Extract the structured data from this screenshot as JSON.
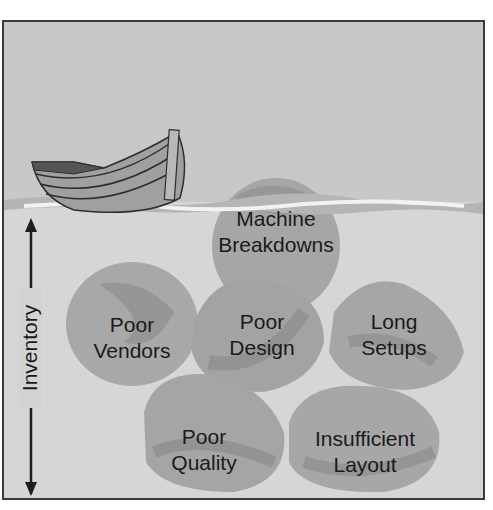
{
  "diagram": {
    "title": "",
    "axis": {
      "label": "Inventory",
      "direction": "vertical, bidirectional arrow"
    },
    "rocks": [
      {
        "id": "machine-breakdowns",
        "line1": "Machine",
        "line2": "Breakdowns"
      },
      {
        "id": "poor-vendors",
        "line1": "Poor",
        "line2": "Vendors"
      },
      {
        "id": "poor-design",
        "line1": "Poor",
        "line2": "Design"
      },
      {
        "id": "long-setups",
        "line1": "Long",
        "line2": "Setups"
      },
      {
        "id": "poor-quality",
        "line1": "Poor",
        "line2": "Quality"
      },
      {
        "id": "insufficient-layout",
        "line1": "Insufficient",
        "line2": "Layout"
      }
    ],
    "elements": {
      "boat": "rowboat-icon",
      "water_surface": "waterline"
    },
    "colors": {
      "sky": "#c8c8c8",
      "water": "#d6d6d6",
      "rock": "#a8a8a8",
      "rock_shade": "#959595",
      "boat": "#9a9a9a",
      "boat_interior": "#555555",
      "text": "#1a1a1a",
      "border": "#3a3a3a"
    }
  }
}
